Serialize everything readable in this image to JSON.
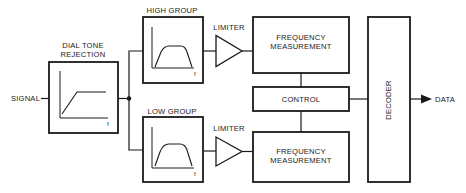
{
  "diagram": {
    "colors": {
      "ink": "#1a1a1a",
      "background": "#ffffff"
    },
    "input_label": "SIGNAL",
    "output_label": "DATA",
    "blocks": {
      "dial_tone": {
        "label_line1": "DIAL TONE",
        "label_line2": "REJECTION",
        "axis_label": "f",
        "response": "high-pass"
      },
      "high_group": {
        "label": "HIGH GROUP",
        "axis_label": "f",
        "response": "band-pass"
      },
      "low_group": {
        "label": "LOW GROUP",
        "axis_label": "f",
        "response": "band-pass"
      },
      "limiter_high": {
        "label": "LIMITER"
      },
      "limiter_low": {
        "label": "LIMITER"
      },
      "freq_high": {
        "label_line1": "FREQUENCY",
        "label_line2": "MEASUREMENT"
      },
      "freq_low": {
        "label_line1": "FREQUENCY",
        "label_line2": "MEASUREMENT"
      },
      "control": {
        "label": "CONTROL"
      },
      "decoder": {
        "label": "DECODER"
      }
    },
    "connections": [
      [
        "SIGNAL",
        "DIAL TONE REJECTION"
      ],
      [
        "DIAL TONE REJECTION",
        "HIGH GROUP"
      ],
      [
        "DIAL TONE REJECTION",
        "LOW GROUP"
      ],
      [
        "HIGH GROUP",
        "LIMITER (high)"
      ],
      [
        "LOW GROUP",
        "LIMITER (low)"
      ],
      [
        "LIMITER (high)",
        "FREQUENCY MEASUREMENT (high)"
      ],
      [
        "LIMITER (low)",
        "FREQUENCY MEASUREMENT (low)"
      ],
      [
        "FREQUENCY MEASUREMENT (high)",
        "CONTROL"
      ],
      [
        "FREQUENCY MEASUREMENT (low)",
        "CONTROL"
      ],
      [
        "CONTROL",
        "DECODER"
      ],
      [
        "DECODER",
        "DATA"
      ]
    ]
  }
}
